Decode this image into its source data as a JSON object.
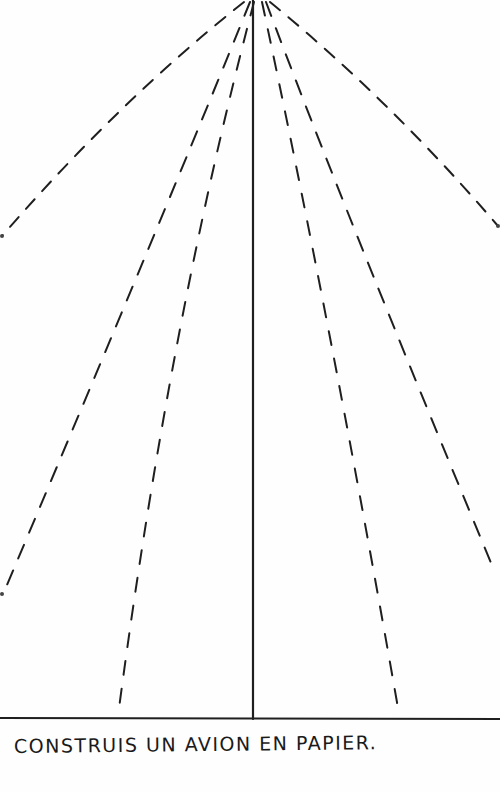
{
  "sheet": {
    "caption": "CONSTRUIS UN AVION EN PAPIER.",
    "ink_color": "#1a1a1a",
    "paper_color": "#fefefe"
  },
  "fold_lines": {
    "apex": [
      258,
      0
    ],
    "center_line": {
      "style": "solid",
      "from": [
        253,
        0
      ],
      "to": [
        253,
        718
      ]
    },
    "baseline": {
      "style": "solid",
      "y": 718
    },
    "dashed": [
      {
        "name": "outer-left",
        "end": [
          0,
          238
        ]
      },
      {
        "name": "outer-right",
        "end": [
          500,
          225
        ]
      },
      {
        "name": "middle-left",
        "end": [
          2,
          595
        ]
      },
      {
        "name": "middle-right",
        "end": [
          494,
          572
        ]
      },
      {
        "name": "inner-left",
        "end": [
          117,
          718
        ]
      },
      {
        "name": "inner-right",
        "end": [
          398,
          710
        ]
      }
    ]
  }
}
